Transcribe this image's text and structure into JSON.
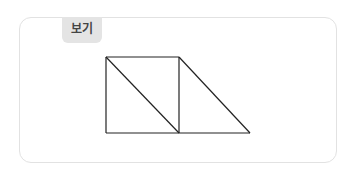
{
  "label": "보기",
  "figure": {
    "stroke_color": "#222222",
    "lines": [
      {
        "x1": 106,
        "y1": 57,
        "x2": 179,
        "y2": 57
      },
      {
        "x1": 106,
        "y1": 57,
        "x2": 106,
        "y2": 133
      },
      {
        "x1": 106,
        "y1": 133,
        "x2": 250,
        "y2": 133
      },
      {
        "x1": 179,
        "y1": 57,
        "x2": 179,
        "y2": 133
      },
      {
        "x1": 106,
        "y1": 57,
        "x2": 179,
        "y2": 133
      },
      {
        "x1": 179,
        "y1": 57,
        "x2": 250,
        "y2": 133
      }
    ]
  }
}
